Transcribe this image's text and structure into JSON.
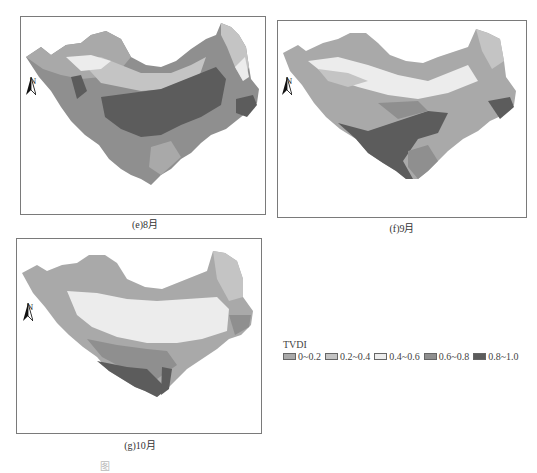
{
  "panels": [
    {
      "id": "e",
      "caption": "(e)8月",
      "north_label": "N"
    },
    {
      "id": "f",
      "caption": "(f)9月",
      "north_label": "N"
    },
    {
      "id": "g",
      "caption": "(g)10月",
      "north_label": "N"
    }
  ],
  "legend": {
    "title": "TVDI",
    "items": [
      {
        "label": "0~0.2",
        "color": "#a9a9a9"
      },
      {
        "label": "0.2~0.4",
        "color": "#c4c4c4"
      },
      {
        "label": "0.4~0.6",
        "color": "#ececec"
      },
      {
        "label": "0.6~0.8",
        "color": "#8f8f8f"
      },
      {
        "label": "0.8~1.0",
        "color": "#5c5c5c"
      }
    ]
  },
  "figure_caption": "图"
}
